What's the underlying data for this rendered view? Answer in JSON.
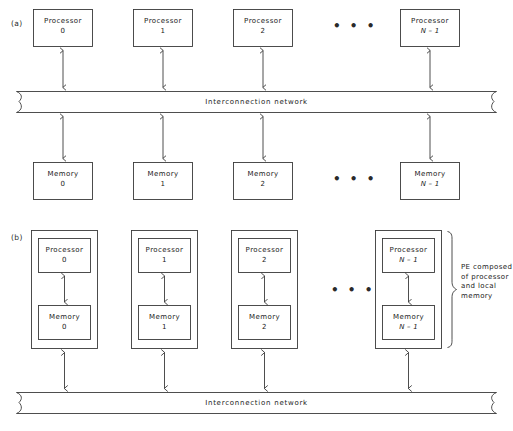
{
  "figure": {
    "panels": [
      {
        "id": "a",
        "label": "(a)"
      },
      {
        "id": "b",
        "label": "(b)"
      }
    ],
    "ellipsis_glyph": "• • •",
    "network_label": "Interconnection network",
    "shared_memory_panel": {
      "processors": [
        {
          "title": "Processor",
          "index": "0"
        },
        {
          "title": "Processor",
          "index": "1"
        },
        {
          "title": "Processor",
          "index": "2"
        },
        {
          "title": "Processor",
          "index": "N – 1"
        }
      ],
      "memories": [
        {
          "title": "Memory",
          "index": "0"
        },
        {
          "title": "Memory",
          "index": "1"
        },
        {
          "title": "Memory",
          "index": "2"
        },
        {
          "title": "Memory",
          "index": "N – 1"
        }
      ],
      "network": "Interconnection network"
    },
    "distributed_memory_panel": {
      "elements": [
        {
          "processor": "Processor",
          "processor_index": "0",
          "memory": "Memory",
          "memory_index": "0"
        },
        {
          "processor": "Processor",
          "processor_index": "1",
          "memory": "Memory",
          "memory_index": "1"
        },
        {
          "processor": "Processor",
          "processor_index": "2",
          "memory": "Memory",
          "memory_index": "2"
        },
        {
          "processor": "Processor",
          "processor_index": "N – 1",
          "memory": "Memory",
          "memory_index": "N – 1"
        }
      ],
      "network": "Interconnection network",
      "annotation": {
        "line1": "PE composed",
        "line2": "of processor",
        "line3": "and local",
        "line4": "memory"
      }
    }
  },
  "colors": {
    "stroke": "#3a3a3a",
    "text": "#1a1a1a",
    "background": "#ffffff"
  }
}
